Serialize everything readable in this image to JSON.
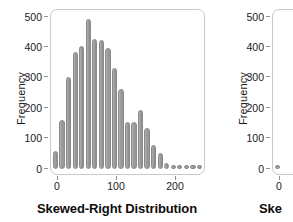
{
  "chart_data": {
    "type": "bar",
    "title": "Skewed-Right Distribution",
    "xlabel": "",
    "ylabel": "Frequency",
    "xlim": [
      -2,
      232
    ],
    "ylim": [
      0,
      530
    ],
    "grid": false,
    "legend": "none",
    "bin_width": 10,
    "categories": [
      5,
      15,
      25,
      35,
      45,
      55,
      65,
      75,
      85,
      95,
      105,
      115,
      125,
      135,
      145,
      155,
      165,
      175,
      185,
      195,
      205,
      215,
      225
    ],
    "values": [
      60,
      165,
      310,
      395,
      415,
      505,
      440,
      435,
      410,
      340,
      270,
      160,
      160,
      200,
      140,
      80,
      55,
      20,
      10,
      10,
      10,
      8,
      8
    ],
    "x_ticks": [
      0,
      100,
      200
    ],
    "x_tick_labels": [
      "0",
      "100",
      "200"
    ],
    "y_ticks": [
      0,
      100,
      200,
      300,
      400,
      500
    ],
    "y_tick_labels": [
      "0",
      "100",
      "200",
      "300",
      "400",
      "500"
    ],
    "bar_color": "#9b9b9b",
    "bar_edge_color": "#8a8a8a",
    "frame_color": "#c9c9c9"
  },
  "chart_data_right": {
    "type": "bar",
    "title": "Ske",
    "ylabel": "Frequency",
    "y_ticks": [
      0,
      100,
      200,
      300,
      400,
      500
    ],
    "y_tick_labels": [
      "0",
      "100",
      "200",
      "300",
      "400",
      "500"
    ],
    "x_ticks": [
      0
    ],
    "x_tick_labels": [
      "0"
    ],
    "categories": [
      5
    ],
    "values": [
      8
    ],
    "note": "second panel clipped at right edge of screenshot"
  },
  "left_panel": {
    "title": "Skewed-Right Distribution",
    "ylabel": "Frequency",
    "y_tick_labels": [
      "500",
      "400",
      "300",
      "200",
      "100",
      "0"
    ],
    "x_tick_labels": [
      "0",
      "100",
      "200"
    ]
  },
  "right_panel": {
    "title": "Ske",
    "ylabel": "Frequency",
    "y_tick_labels": [
      "500",
      "400",
      "300",
      "200",
      "100",
      "0"
    ],
    "x_tick_labels": [
      "0"
    ]
  }
}
